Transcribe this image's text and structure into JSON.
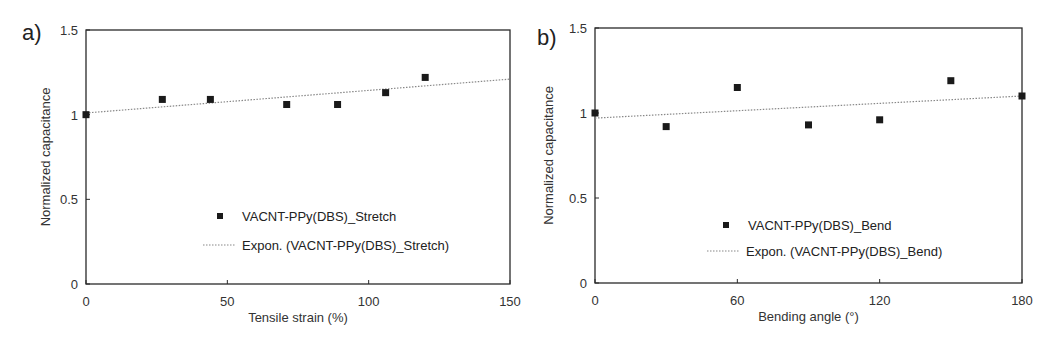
{
  "chart_data": [
    {
      "type": "scatter",
      "panel_label": "a)",
      "title": "",
      "xlabel": "Tensile strain (%)",
      "ylabel": "Normalized capacitance",
      "xlim": [
        0,
        150
      ],
      "ylim": [
        0,
        1.5
      ],
      "xticks": [
        "0",
        "50",
        "100",
        "150"
      ],
      "yticks": [
        "0",
        "0.5",
        "1",
        "1.5"
      ],
      "grid": false,
      "legend_position": "lower center (inside)",
      "series": [
        {
          "name": "VACNT-PPy(DBS)_Stretch",
          "marker": "square",
          "x": [
            0,
            27,
            44,
            71,
            89,
            106,
            120
          ],
          "y": [
            1.0,
            1.09,
            1.09,
            1.06,
            1.06,
            1.13,
            1.22
          ]
        },
        {
          "name": "Expon. (VACNT-PPy(DBS)_Stretch)",
          "style": "dotted trendline",
          "x": [
            0,
            150
          ],
          "y": [
            1.01,
            1.21
          ]
        }
      ]
    },
    {
      "type": "scatter",
      "panel_label": "b)",
      "title": "",
      "xlabel": "Bending angle (°)",
      "ylabel": "Normalized capacitance",
      "xlim": [
        0,
        180
      ],
      "ylim": [
        0,
        1.5
      ],
      "xticks": [
        "0",
        "60",
        "120",
        "180"
      ],
      "yticks": [
        "0",
        "0.5",
        "1",
        "1.5"
      ],
      "grid": false,
      "legend_position": "lower center (inside)",
      "series": [
        {
          "name": "VACNT-PPy(DBS)_Bend",
          "marker": "square",
          "x": [
            0,
            30,
            60,
            90,
            120,
            150,
            180
          ],
          "y": [
            1.0,
            0.92,
            1.15,
            0.93,
            0.96,
            1.19,
            1.1
          ]
        },
        {
          "name": "Expon. (VACNT-PPy(DBS)_Bend)",
          "style": "dotted trendline",
          "x": [
            0,
            180
          ],
          "y": [
            0.97,
            1.1
          ]
        }
      ]
    }
  ],
  "colors": {
    "marker": "#1a1a1a",
    "axis": "#2a2a2a",
    "trendline": "#888888"
  }
}
